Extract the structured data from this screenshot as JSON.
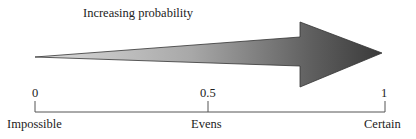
{
  "diagram": {
    "title": "Increasing probability",
    "arrow": {
      "direction": "right",
      "gradient_start": "#d9d9d9",
      "gradient_end": "#444444"
    },
    "scale": {
      "ticks": [
        {
          "value": "0",
          "label": "Impossible"
        },
        {
          "value": "0.5",
          "label": "Evens"
        },
        {
          "value": "1",
          "label": "Certain"
        }
      ]
    }
  }
}
